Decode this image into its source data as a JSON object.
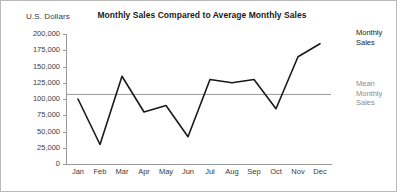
{
  "chart_data": {
    "type": "line",
    "title": "Monthly Sales Compared to Average Monthly Sales",
    "xlabel": "",
    "ylabel": "U.S. Dollars",
    "categories": [
      "Jan",
      "Feb",
      "Mar",
      "Apr",
      "May",
      "Jun",
      "Jul",
      "Aug",
      "Sep",
      "Oct",
      "Nov",
      "Dec"
    ],
    "series": [
      {
        "name": "Monthly Sales",
        "color": "#1a1a1a",
        "values": [
          100000,
          30000,
          135000,
          80000,
          90000,
          42000,
          130000,
          125000,
          130000,
          85000,
          165000,
          185000
        ]
      },
      {
        "name": "Mean Monthly Sales",
        "color": "#9a9a9a",
        "type": "reference-line",
        "value": 107000
      }
    ],
    "ylim": [
      0,
      200000
    ],
    "ytick_values": [
      200000,
      175000,
      150000,
      125000,
      100000,
      75000,
      50000,
      25000,
      0
    ],
    "ytick_labels": [
      "200,000",
      "175,000",
      "150,000",
      "125,000",
      "100,000",
      "75,000",
      "50,000",
      "25,000",
      "0"
    ],
    "grid": false,
    "legend_position": "right"
  },
  "legend": {
    "series_line1": "Monthly",
    "series_line2": "Sales",
    "mean_line1": "Mean",
    "mean_line2": "Monthly",
    "mean_line3": "Sales"
  }
}
